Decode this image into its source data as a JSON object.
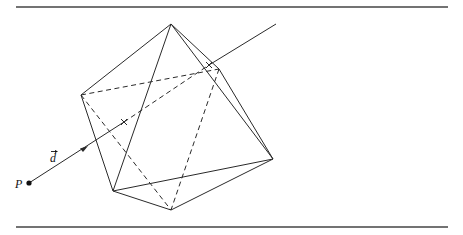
{
  "figure": {
    "labels": {
      "point": "P",
      "direction": "d"
    },
    "vertices": {
      "top": [
        171,
        24
      ],
      "left": [
        81,
        95
      ],
      "upper_right": [
        219,
        69
      ],
      "right": [
        273,
        159
      ],
      "bottom_left": [
        113,
        191
      ],
      "bottom": [
        171,
        210
      ]
    },
    "ray": {
      "origin": [
        29,
        183
      ],
      "end": [
        276,
        24
      ],
      "entry_mark": [
        124,
        122
      ],
      "exit_mark": [
        209,
        65
      ]
    },
    "colors": {
      "stroke": "#2a2a2a",
      "background": "#ffffff"
    }
  }
}
